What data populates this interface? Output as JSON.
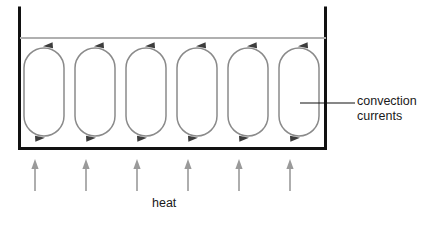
{
  "diagram": {
    "title_labels": {
      "convection_line1": "convection",
      "convection_line2": "currents",
      "heat": "heat"
    },
    "colors": {
      "container_wall": "#111111",
      "water_surface": "#b0b0b0",
      "convection_loop": "#8a8a8a",
      "convection_arrowhead": "#444444",
      "heat_arrow": "#9a9a9a",
      "leader_line": "#111111",
      "text": "#1a1a1a",
      "background": "#ffffff"
    },
    "container": {
      "left": 18,
      "right": 327,
      "top": 8,
      "bottom": 150,
      "wall_thickness": 3
    },
    "water_surface": {
      "y": 38,
      "x_start": 20,
      "x_end": 326
    },
    "convection_cells": {
      "count": 6,
      "first_center_x": 44,
      "pitch": 51,
      "top_y": 48,
      "bottom_y": 136,
      "half_width": 20,
      "corner_radius": 20,
      "circulation": "counter-clockwise",
      "top_arrow_direction": "left",
      "bottom_arrow_direction": "right"
    },
    "heat_arrows": {
      "count": 6,
      "first_x": 35,
      "pitch": 51,
      "y_tail": 191,
      "y_head": 160,
      "stroke_width": 1.6
    },
    "leader": {
      "x_start": 300,
      "x_end": 355,
      "y": 103
    }
  }
}
